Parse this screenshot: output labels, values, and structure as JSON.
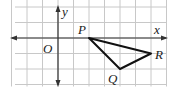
{
  "diagram": {
    "type": "coordinate-grid-triangle",
    "grid": {
      "x_min": -3,
      "x_max": 7,
      "y_min": -3,
      "y_max": 2
    },
    "axes": {
      "x_label": "x",
      "y_label": "y",
      "origin_label": "O"
    },
    "points": [
      {
        "name": "P",
        "x": 2,
        "y": 0
      },
      {
        "name": "Q",
        "x": 4,
        "y": -2
      },
      {
        "name": "R",
        "x": 6,
        "y": -1
      }
    ],
    "polygon": [
      "P",
      "Q",
      "R"
    ],
    "colors": {
      "grid": "#c8c8c8",
      "axis": "#333333",
      "triangle": "#111111"
    }
  }
}
